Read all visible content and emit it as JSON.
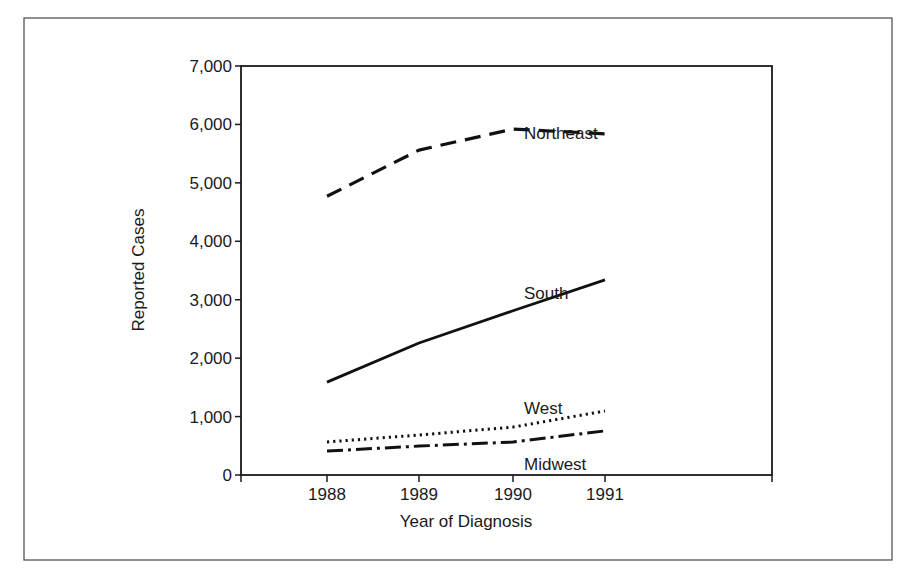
{
  "chart_data": {
    "type": "line",
    "title": "",
    "xlabel": "Year of Diagnosis",
    "ylabel": "Reported Cases",
    "ylim": [
      0,
      7000
    ],
    "yticks": [
      0,
      1000,
      2000,
      3000,
      4000,
      5000,
      6000,
      7000
    ],
    "ytick_labels": [
      "0",
      "1,000",
      "2,000",
      "3,000",
      "4,000",
      "5,000",
      "6,000",
      "7,000"
    ],
    "categories": [
      "1988",
      "1989",
      "1990",
      "1991"
    ],
    "grid": false,
    "legend": "inline labels",
    "series": [
      {
        "name": "Northeast",
        "style": "dashed",
        "values": [
          4770,
          5560,
          5920,
          5840
        ]
      },
      {
        "name": "South",
        "style": "solid",
        "values": [
          1590,
          2260,
          2810,
          3340
        ]
      },
      {
        "name": "West",
        "style": "dotted",
        "values": [
          565,
          685,
          820,
          1095
        ]
      },
      {
        "name": "Midwest",
        "style": "dash-dot",
        "values": [
          410,
          495,
          565,
          755
        ]
      }
    ]
  },
  "labels": {
    "northeast": "Northeast",
    "south": "South",
    "west": "West",
    "midwest": "Midwest"
  }
}
